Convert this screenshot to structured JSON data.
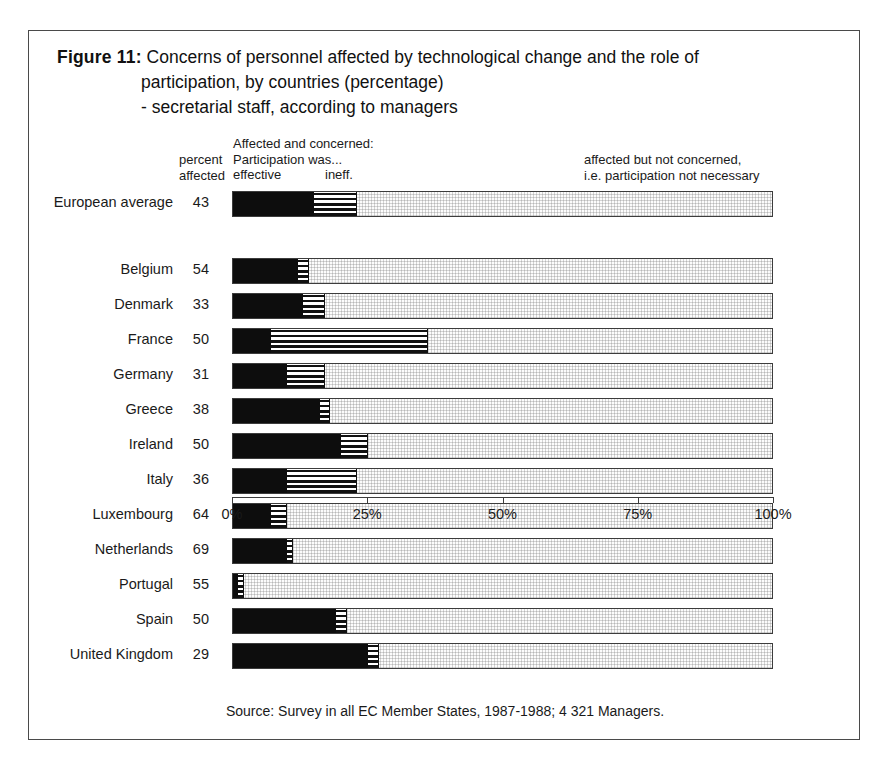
{
  "figure": {
    "label": "Figure 11:",
    "title_line_1": "Concerns of personnel affected by technological change and the role of",
    "title_line_2": "participation, by countries (percentage)",
    "title_line_3": "- secretarial staff, according to managers"
  },
  "legend": {
    "percent_line_1": "percent",
    "percent_line_2": "affected",
    "center_line_1": "Affected and concerned:",
    "center_line_2": "Participation was...",
    "center_effective": "effective",
    "center_ineffective": "ineff.",
    "right_line_1": "affected but not concerned,",
    "right_line_2": "i.e. participation not necessary"
  },
  "source": "Source: Survey in all EC Member States, 1987-1988; 4 321 Managers.",
  "colors": {
    "effective": "#0d0d0d",
    "ineffective": "#111111",
    "not_concerned": "#fcfcfc",
    "frame": "#4a4a4a"
  },
  "chart_data": {
    "type": "bar",
    "orientation": "horizontal",
    "stacked": true,
    "title": "Concerns of personnel affected by technological change and the role of participation, by countries (percentage) - secretarial staff, according to managers",
    "xlabel": "",
    "ylabel": "",
    "xlim": [
      0,
      100
    ],
    "xticks": [
      0,
      25,
      50,
      75,
      100
    ],
    "xtick_labels": [
      "0%",
      "25%",
      "50%",
      "75%",
      "100%"
    ],
    "grid": false,
    "legend_position": "top",
    "series": [
      {
        "name": "Affected and concerned: participation was effective",
        "key": "effective"
      },
      {
        "name": "Affected and concerned: participation was ineffective",
        "key": "ineffective"
      },
      {
        "name": "Affected but not concerned, i.e. participation not necessary",
        "key": "not_concerned"
      }
    ],
    "categories": [
      "European average",
      "Belgium",
      "Denmark",
      "France",
      "Germany",
      "Greece",
      "Ireland",
      "Italy",
      "Luxembourg",
      "Netherlands",
      "Portugal",
      "Spain",
      "United Kingdom"
    ],
    "rows": [
      {
        "label": "European average",
        "percent_affected": "43",
        "effective": 15,
        "ineffective": 8,
        "not_concerned": 77,
        "separated": true
      },
      {
        "label": "Belgium",
        "percent_affected": "54",
        "effective": 12,
        "ineffective": 2,
        "not_concerned": 86,
        "separated": false
      },
      {
        "label": "Denmark",
        "percent_affected": "33",
        "effective": 13,
        "ineffective": 4,
        "not_concerned": 83,
        "separated": false
      },
      {
        "label": "France",
        "percent_affected": "50",
        "effective": 7,
        "ineffective": 29,
        "not_concerned": 64,
        "separated": false
      },
      {
        "label": "Germany",
        "percent_affected": "31",
        "effective": 10,
        "ineffective": 7,
        "not_concerned": 83,
        "separated": false
      },
      {
        "label": "Greece",
        "percent_affected": "38",
        "effective": 16,
        "ineffective": 2,
        "not_concerned": 82,
        "separated": false
      },
      {
        "label": "Ireland",
        "percent_affected": "50",
        "effective": 20,
        "ineffective": 5,
        "not_concerned": 75,
        "separated": false
      },
      {
        "label": "Italy",
        "percent_affected": "36",
        "effective": 10,
        "ineffective": 13,
        "not_concerned": 77,
        "separated": false
      },
      {
        "label": "Luxembourg",
        "percent_affected": "64",
        "effective": 7,
        "ineffective": 3,
        "not_concerned": 90,
        "separated": false
      },
      {
        "label": "Netherlands",
        "percent_affected": "69",
        "effective": 10,
        "ineffective": 1,
        "not_concerned": 89,
        "separated": false
      },
      {
        "label": "Portugal",
        "percent_affected": "55",
        "effective": 1,
        "ineffective": 1,
        "not_concerned": 98,
        "separated": false
      },
      {
        "label": "Spain",
        "percent_affected": "50",
        "effective": 19,
        "ineffective": 2,
        "not_concerned": 79,
        "separated": false
      },
      {
        "label": "United Kingdom",
        "percent_affected": "29",
        "effective": 25,
        "ineffective": 2,
        "not_concerned": 73,
        "separated": false
      }
    ]
  }
}
